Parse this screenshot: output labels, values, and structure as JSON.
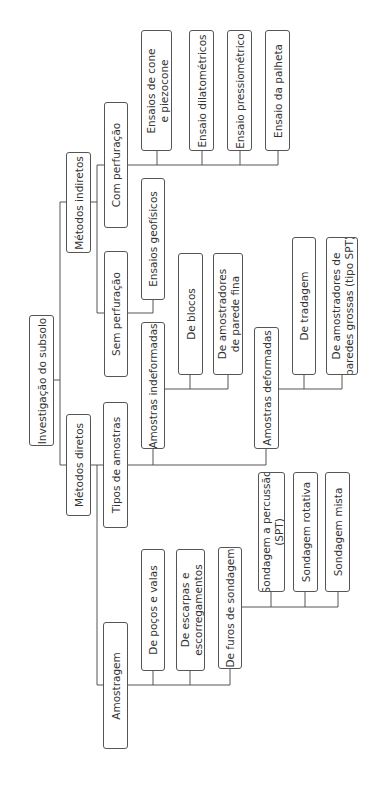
{
  "diagram": {
    "title": "Investigação do subsolo",
    "orientation": "rotated-90-ccw",
    "colors": {
      "line": "#555555",
      "text": "#333333",
      "background": "#ffffff"
    },
    "nodes": {
      "root": {
        "lines": [
          "Investigação do subsolo"
        ]
      },
      "indiretos": {
        "lines": [
          "Métodos indiretos"
        ]
      },
      "diretos": {
        "lines": [
          "Métodos diretos"
        ]
      },
      "com_perf": {
        "lines": [
          "Com perfuração"
        ]
      },
      "sem_perf": {
        "lines": [
          "Sem perfuração"
        ]
      },
      "cone": {
        "lines": [
          "Ensaios de cone",
          "e piezocone"
        ]
      },
      "dilato": {
        "lines": [
          "Ensaio dilatométricos"
        ]
      },
      "pressio": {
        "lines": [
          "Ensaio pressiométrico"
        ]
      },
      "palheta": {
        "lines": [
          "Ensaio da palheta"
        ]
      },
      "geofisicos": {
        "lines": [
          "Ensaios geofísicos"
        ]
      },
      "tipos": {
        "lines": [
          "Tipos de amostras"
        ]
      },
      "indeformadas": {
        "lines": [
          "Amostras indeformadas"
        ]
      },
      "blocos": {
        "lines": [
          "De blocos"
        ]
      },
      "parede_fina": {
        "lines": [
          "De amostradores",
          "de parede fina"
        ]
      },
      "deformadas": {
        "lines": [
          "Amostras deformadas"
        ]
      },
      "tradagem": {
        "lines": [
          "De tradagem"
        ]
      },
      "paredes_grossas": {
        "lines": [
          "De amostradores de",
          "paredes grossas (tipo SPT)"
        ]
      },
      "amostragem": {
        "lines": [
          "Amostragem"
        ]
      },
      "pocos": {
        "lines": [
          "De poços e valas"
        ]
      },
      "escarpas": {
        "lines": [
          "De escarpas e",
          "escorregamentos"
        ]
      },
      "furos": {
        "lines": [
          "De furos de sondagem"
        ]
      },
      "spt": {
        "lines": [
          "Sondagem a percussão",
          "(SPT)"
        ]
      },
      "rotativa": {
        "lines": [
          "Sondagem rotativa"
        ]
      },
      "mista": {
        "lines": [
          "Sondagem mista"
        ]
      }
    },
    "edges": [
      [
        "root",
        "indiretos"
      ],
      [
        "root",
        "diretos"
      ],
      [
        "indiretos",
        "com_perf"
      ],
      [
        "indiretos",
        "sem_perf"
      ],
      [
        "com_perf",
        "cone"
      ],
      [
        "com_perf",
        "dilato"
      ],
      [
        "com_perf",
        "pressio"
      ],
      [
        "com_perf",
        "palheta"
      ],
      [
        "sem_perf",
        "geofisicos"
      ],
      [
        "diretos",
        "tipos"
      ],
      [
        "diretos",
        "amostragem"
      ],
      [
        "tipos",
        "indeformadas"
      ],
      [
        "tipos",
        "deformadas"
      ],
      [
        "indeformadas",
        "blocos"
      ],
      [
        "indeformadas",
        "parede_fina"
      ],
      [
        "deformadas",
        "tradagem"
      ],
      [
        "deformadas",
        "paredes_grossas"
      ],
      [
        "amostragem",
        "pocos"
      ],
      [
        "amostragem",
        "escarpas"
      ],
      [
        "amostragem",
        "furos"
      ],
      [
        "furos",
        "spt"
      ],
      [
        "furos",
        "rotativa"
      ],
      [
        "furos",
        "mista"
      ]
    ]
  }
}
